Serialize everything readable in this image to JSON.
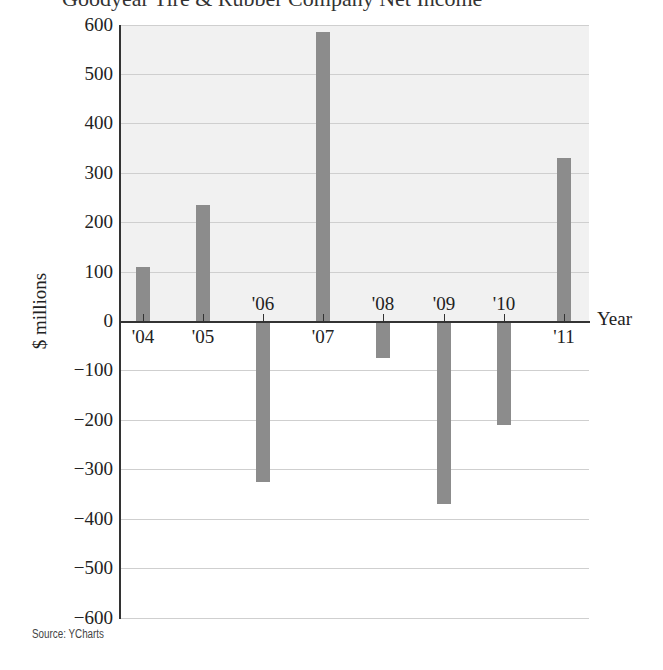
{
  "chart_data": {
    "type": "bar",
    "title": "Goodyear Tire & Rubber Company Net Income",
    "xlabel": "Year",
    "ylabel": "$ millions",
    "categories": [
      "'04",
      "'05",
      "'06",
      "'07",
      "'08",
      "'09",
      "'10",
      "'11"
    ],
    "values": [
      110,
      235,
      -325,
      585,
      -75,
      -370,
      -210,
      330
    ],
    "ylim": [
      -600,
      600
    ],
    "yticks": [
      600,
      500,
      400,
      300,
      200,
      100,
      0,
      -100,
      -200,
      -300,
      -400,
      -500,
      -600
    ],
    "ytick_labels": [
      "600",
      "500",
      "400",
      "300",
      "200",
      "100",
      "0",
      "−100",
      "−200",
      "−300",
      "−400",
      "−500",
      "−600"
    ],
    "grid": true,
    "legend": "none",
    "source": "Source: YCharts",
    "colors": {
      "bar": "#8c8c8c",
      "positive_region_bg": "#f1f1f1",
      "grid": "#cfcfcf",
      "axis": "#333333"
    }
  },
  "labels": {
    "title": "Goodyear Tire & Rubber Company Net Income",
    "ylabel": "$ millions",
    "xlabel": "Year",
    "source": "Source: YCharts"
  }
}
